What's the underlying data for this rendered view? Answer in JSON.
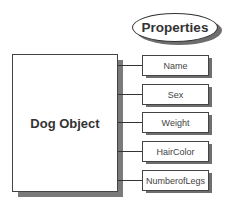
{
  "header": {
    "label": "Properties"
  },
  "object": {
    "label": "Dog Object"
  },
  "properties": [
    {
      "label": "Name",
      "top": 55
    },
    {
      "label": "Sex",
      "top": 84
    },
    {
      "label": "Weight",
      "top": 112
    },
    {
      "label": "HairColor",
      "top": 141
    },
    {
      "label": "NumberofLegs",
      "top": 170
    }
  ],
  "colors": {
    "shadow": "#6e6e6e",
    "border": "#444444",
    "text": "#333333"
  }
}
